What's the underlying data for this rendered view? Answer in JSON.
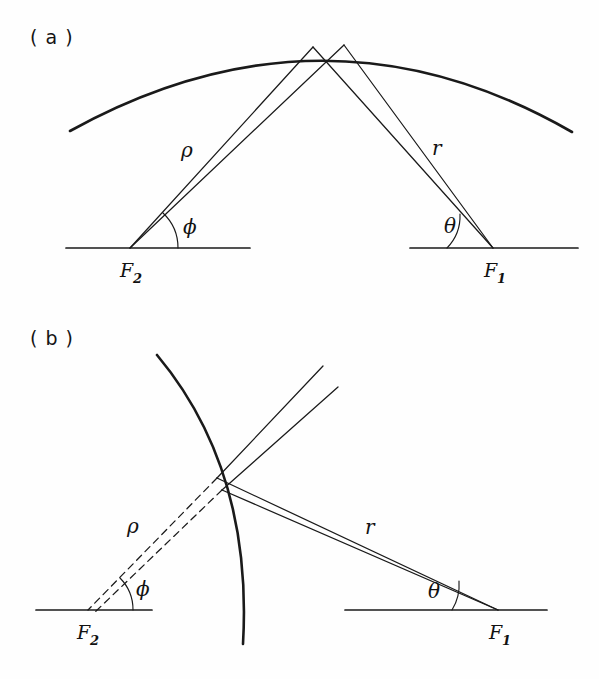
{
  "figure": {
    "caption_visible": false,
    "background_color": "#fefefe",
    "ink_color": "#1a1a1a",
    "width": 599,
    "height": 679
  },
  "panels": [
    {
      "id": "a",
      "label": "( a )",
      "surface_type": "convex-arc",
      "labels": {
        "rho": "ρ",
        "r": "r",
        "phi": "ϕ",
        "theta": "θ",
        "focus_left_letter": "F",
        "focus_left_sub": "2",
        "focus_right_letter": "F",
        "focus_right_sub": "1"
      }
    },
    {
      "id": "b",
      "label": "( b )",
      "surface_type": "concave-arc",
      "labels": {
        "rho": "ρ",
        "r": "r",
        "phi": "ϕ",
        "theta": "θ",
        "focus_left_letter": "F",
        "focus_left_sub": "2",
        "focus_right_letter": "F",
        "focus_right_sub": "1"
      }
    }
  ]
}
